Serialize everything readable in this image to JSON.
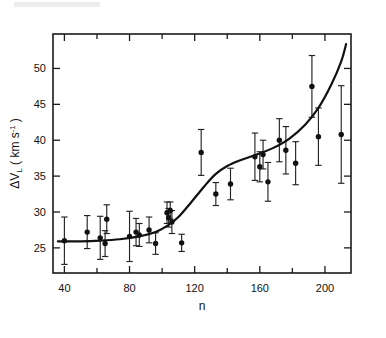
{
  "figure": {
    "background": "#ffffff",
    "ink_color": "#111111"
  },
  "chart_data": {
    "type": "scatter",
    "title": "",
    "xlabel": "n",
    "ylabel": "ΔV_L ( km s^-1 )",
    "ylabel_parts": {
      "delta": "ΔV",
      "sub": "L",
      "unit_open": " ( km s",
      "exp": "-1",
      "unit_close": " )"
    },
    "xlim": [
      33,
      216
    ],
    "ylim": [
      21.5,
      54.8
    ],
    "xticks_major": [
      40,
      80,
      120,
      160,
      200
    ],
    "xtick_labels": [
      "40",
      "80",
      "120",
      "160",
      "200"
    ],
    "xticks_minor": [
      60,
      100,
      140,
      180,
      200
    ],
    "yticks_major": [
      25,
      30,
      35,
      40,
      45,
      50
    ],
    "ytick_labels": [
      "25",
      "30",
      "35",
      "40",
      "45",
      "50"
    ],
    "grid": false,
    "legend": null,
    "errorbars": "symmetric vertical 1-sigma",
    "points": [
      {
        "n": 40,
        "v": 26.0,
        "err": 3.3
      },
      {
        "n": 54,
        "v": 27.2,
        "err": 2.3
      },
      {
        "n": 62,
        "v": 26.4,
        "err": 3.0
      },
      {
        "n": 65,
        "v": 25.6,
        "err": 1.8
      },
      {
        "n": 66,
        "v": 29.0,
        "err": 2.0
      },
      {
        "n": 80,
        "v": 26.6,
        "err": 3.5
      },
      {
        "n": 84,
        "v": 27.2,
        "err": 1.9
      },
      {
        "n": 86,
        "v": 26.8,
        "err": 1.6
      },
      {
        "n": 92,
        "v": 27.5,
        "err": 1.8
      },
      {
        "n": 96,
        "v": 25.6,
        "err": 1.5
      },
      {
        "n": 103,
        "v": 29.9,
        "err": 1.5
      },
      {
        "n": 104,
        "v": 29.2,
        "err": 1.3
      },
      {
        "n": 105,
        "v": 30.2,
        "err": 1.2
      },
      {
        "n": 106,
        "v": 28.6,
        "err": 1.6
      },
      {
        "n": 112,
        "v": 25.7,
        "err": 1.2
      },
      {
        "n": 124,
        "v": 38.3,
        "err": 3.2
      },
      {
        "n": 133,
        "v": 32.5,
        "err": 1.6
      },
      {
        "n": 142,
        "v": 33.9,
        "err": 2.2
      },
      {
        "n": 157,
        "v": 37.7,
        "err": 3.3
      },
      {
        "n": 160,
        "v": 36.3,
        "err": 2.1
      },
      {
        "n": 162,
        "v": 38.0,
        "err": 2.0
      },
      {
        "n": 165,
        "v": 34.2,
        "err": 2.7
      },
      {
        "n": 172,
        "v": 40.0,
        "err": 3.0
      },
      {
        "n": 176,
        "v": 38.6,
        "err": 3.3
      },
      {
        "n": 182,
        "v": 36.8,
        "err": 3.0
      },
      {
        "n": 192,
        "v": 47.5,
        "err": 4.3
      },
      {
        "n": 196,
        "v": 40.5,
        "err": 4.0
      },
      {
        "n": 210,
        "v": 40.8,
        "err": 6.8
      }
    ],
    "curve": [
      {
        "n": 36,
        "v": 25.9
      },
      {
        "n": 50,
        "v": 25.9
      },
      {
        "n": 62,
        "v": 26.0
      },
      {
        "n": 74,
        "v": 26.2
      },
      {
        "n": 86,
        "v": 26.6
      },
      {
        "n": 96,
        "v": 27.2
      },
      {
        "n": 104,
        "v": 28.2
      },
      {
        "n": 110,
        "v": 29.3
      },
      {
        "n": 118,
        "v": 31.4
      },
      {
        "n": 126,
        "v": 33.6
      },
      {
        "n": 133,
        "v": 35.3
      },
      {
        "n": 140,
        "v": 36.4
      },
      {
        "n": 148,
        "v": 37.2
      },
      {
        "n": 158,
        "v": 38.0
      },
      {
        "n": 168,
        "v": 38.9
      },
      {
        "n": 178,
        "v": 40.2
      },
      {
        "n": 188,
        "v": 42.2
      },
      {
        "n": 196,
        "v": 44.5
      },
      {
        "n": 204,
        "v": 47.8
      },
      {
        "n": 210,
        "v": 51.0
      },
      {
        "n": 213,
        "v": 53.4
      }
    ]
  }
}
